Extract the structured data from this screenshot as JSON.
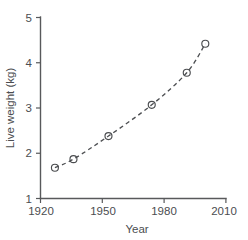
{
  "chart_data": {
    "type": "scatter",
    "title": "",
    "subtitle": "",
    "xlabel": "Year",
    "ylabel": "Live weight (kg)",
    "xlim": [
      1920,
      2010
    ],
    "ylim": [
      1,
      5
    ],
    "xticks": [
      1920,
      1950,
      1980,
      2010
    ],
    "xtick_labels": [
      "1920",
      "1950",
      "1980",
      "2010"
    ],
    "yticks": [
      1,
      2,
      3,
      4,
      5
    ],
    "ytick_labels": [
      "1",
      "2",
      "3",
      "4",
      "5"
    ],
    "grid": false,
    "legend": null,
    "marker": "open-circle",
    "x": [
      1927,
      1936,
      1953,
      1974,
      1991,
      2000
    ],
    "values": [
      1.68,
      1.87,
      2.38,
      3.07,
      3.78,
      4.42
    ],
    "series": [
      {
        "name": "Live weight",
        "x": [
          1927,
          1936,
          1953,
          1974,
          1991,
          2000
        ],
        "values": [
          1.68,
          1.87,
          2.38,
          3.07,
          3.78,
          4.42
        ]
      },
      {
        "name": "fitted trend",
        "style": "dashed",
        "x": [
          1927,
          1936,
          1953,
          1974,
          1991,
          2000
        ],
        "values": [
          1.68,
          1.87,
          2.38,
          3.07,
          3.78,
          4.42
        ]
      }
    ],
    "annotations": []
  },
  "axis_labels": {
    "x_title": "Year",
    "y_title": "Live weight (kg)",
    "x_ticks": [
      "1920",
      "1950",
      "1980",
      "2010"
    ],
    "y_ticks": [
      "5",
      "4",
      "3",
      "2",
      "1"
    ]
  },
  "colors": {
    "axis": "#58595b",
    "marker": "#4a4c4f",
    "curve": "#4d4f52",
    "background": "#ffffff"
  }
}
